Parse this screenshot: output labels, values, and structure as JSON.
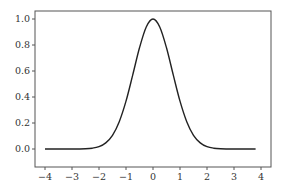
{
  "chart_data": {
    "type": "line",
    "title": "",
    "xlabel": "",
    "ylabel": "",
    "xlim": [
      -4.3,
      4.2
    ],
    "ylim": [
      -0.07,
      1.05
    ],
    "grid": false,
    "legend": null,
    "xticks": [
      -4,
      -3,
      -2,
      -1,
      0,
      1,
      2,
      3,
      4
    ],
    "xtick_labels": [
      "−4",
      "−3",
      "−2",
      "−1",
      "0",
      "1",
      "2",
      "3",
      "4"
    ],
    "yticks": [
      0.0,
      0.2,
      0.4,
      0.6,
      0.8,
      1.0
    ],
    "ytick_labels": [
      "0.0",
      "0.2",
      "0.4",
      "0.6",
      "0.8",
      "1.0"
    ],
    "series": [
      {
        "name": "exp(-x^2)",
        "color": "#222222",
        "x": [
          -4.0,
          -3.5,
          -3.0,
          -2.5,
          -2.25,
          -2.0,
          -1.75,
          -1.5,
          -1.25,
          -1.0,
          -0.75,
          -0.5,
          -0.25,
          0.0,
          0.25,
          0.5,
          0.75,
          1.0,
          1.25,
          1.5,
          1.75,
          2.0,
          2.25,
          2.5,
          3.0,
          3.5,
          3.8
        ],
        "y": [
          0.0,
          0.0,
          0.0,
          0.002,
          0.006,
          0.018,
          0.047,
          0.105,
          0.21,
          0.368,
          0.57,
          0.779,
          0.939,
          1.0,
          0.939,
          0.779,
          0.57,
          0.368,
          0.21,
          0.105,
          0.047,
          0.018,
          0.006,
          0.002,
          0.0,
          0.0,
          0.0
        ]
      }
    ]
  },
  "colors": {
    "axis": "#555555",
    "line": "#222222",
    "background": "#ffffff"
  }
}
